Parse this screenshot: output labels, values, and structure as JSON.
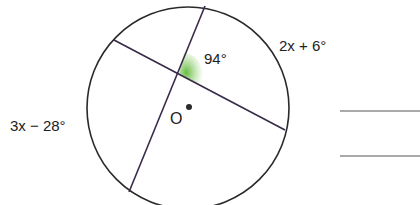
{
  "diagram": {
    "circle": {
      "cx": 188,
      "cy": 108,
      "r": 101
    },
    "chords": [
      {
        "x1": 114,
        "y1": 40,
        "x2": 285,
        "y2": 130
      },
      {
        "x1": 205,
        "y1": 6,
        "x2": 129,
        "y2": 192
      }
    ],
    "center_point": {
      "label": "O",
      "x": 189,
      "y": 107
    },
    "angle_label": "94°",
    "arc_labels": {
      "upper_right": "2x + 6°",
      "left": "3x − 28°"
    },
    "colors": {
      "stroke": "#2a2a2a",
      "chord": "#3a2a4a",
      "angle_highlight": "#7cc45a",
      "answer_line": "#555555"
    },
    "answer_lines": 2
  }
}
